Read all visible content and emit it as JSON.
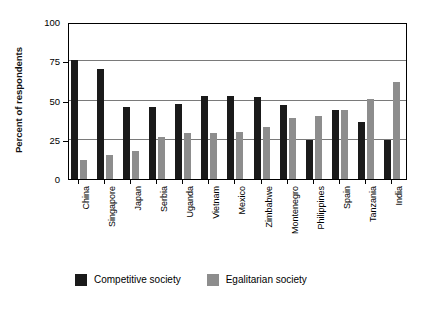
{
  "chart_data": {
    "type": "bar",
    "title": "",
    "xlabel": "",
    "ylabel": "Percent of respondents",
    "ylim": [
      0,
      100
    ],
    "yticks": [
      0,
      25,
      50,
      75,
      100
    ],
    "ytick_labels": [
      "0",
      "25",
      "50",
      "75",
      "100"
    ],
    "grid": true,
    "legend_position": "bottom",
    "categories": [
      "China",
      "Singapore",
      "Japan",
      "Serbia",
      "Uganda",
      "Vietnam",
      "Mexico",
      "Zimbabwe",
      "Montenegro",
      "Philippines",
      "Spain",
      "Tanzania",
      "India"
    ],
    "series": [
      {
        "name": "Competitive society",
        "color": "#1a1a1a",
        "values": [
          76,
          70,
          46,
          46,
          48,
          53,
          53,
          52,
          47,
          25,
          44,
          36,
          25
        ]
      },
      {
        "name": "Egalitarian society",
        "color": "#8d8d8d",
        "values": [
          12,
          15,
          18,
          27,
          29,
          29,
          30,
          33,
          39,
          40,
          44,
          51,
          62
        ]
      }
    ]
  },
  "legend": {
    "entries": [
      {
        "label": "Competitive society",
        "swatch": "competitive"
      },
      {
        "label": "Egalitarian society",
        "swatch": "egalitarian"
      }
    ]
  }
}
